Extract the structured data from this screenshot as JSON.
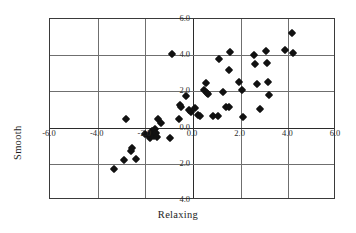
{
  "chart_data": {
    "type": "scatter",
    "title": "",
    "xlabel": "Relaxing",
    "ylabel": "Smooth",
    "xlim": [
      -6.0,
      6.0
    ],
    "ylim": [
      -4.0,
      6.0
    ],
    "xticks": [
      -6.0,
      -4.0,
      -2.0,
      0.0,
      2.0,
      4.0,
      6.0
    ],
    "yticks": [
      -4.0,
      -2.0,
      0.0,
      2.0,
      4.0,
      6.0
    ],
    "xtick_labels": [
      "-6.0",
      "-4.0",
      "-2.0",
      "0.0",
      "2.0",
      "4.0",
      "6.0"
    ],
    "ytick_labels": [
      "4.0",
      "2.0",
      "0.0",
      "2.0",
      "4.0",
      "6.0"
    ],
    "grid": true,
    "legend": false,
    "marker": "diamond",
    "marker_color": "#111111",
    "points": [
      [
        -3.3,
        -2.3
      ],
      [
        -2.9,
        -1.8
      ],
      [
        -2.8,
        0.45
      ],
      [
        -2.6,
        -1.3
      ],
      [
        -2.55,
        -1.1
      ],
      [
        -2.4,
        -1.75
      ],
      [
        -2.0,
        -0.35
      ],
      [
        -1.85,
        -0.45
      ],
      [
        -1.8,
        -0.55
      ],
      [
        -1.75,
        -0.3
      ],
      [
        -1.7,
        -0.2
      ],
      [
        -1.65,
        -0.45
      ],
      [
        -1.6,
        -0.1
      ],
      [
        -1.55,
        -0.3
      ],
      [
        -1.5,
        -0.5
      ],
      [
        -1.45,
        0.45
      ],
      [
        -1.35,
        0.25
      ],
      [
        -0.95,
        -0.6
      ],
      [
        -0.9,
        4.05
      ],
      [
        -0.6,
        0.5
      ],
      [
        -0.55,
        1.25
      ],
      [
        -0.5,
        1.15
      ],
      [
        -0.3,
        1.75
      ],
      [
        -0.15,
        0.95
      ],
      [
        -0.1,
        0.85
      ],
      [
        0.1,
        1.1
      ],
      [
        0.2,
        0.7
      ],
      [
        0.3,
        0.65
      ],
      [
        0.45,
        2.1
      ],
      [
        0.55,
        2.45
      ],
      [
        0.6,
        1.9
      ],
      [
        0.65,
        1.85
      ],
      [
        0.85,
        0.65
      ],
      [
        1.05,
        0.65
      ],
      [
        1.1,
        3.8
      ],
      [
        1.25,
        1.95
      ],
      [
        1.4,
        1.15
      ],
      [
        1.5,
        1.15
      ],
      [
        1.5,
        3.2
      ],
      [
        1.55,
        4.15
      ],
      [
        1.95,
        2.5
      ],
      [
        2.05,
        2.1
      ],
      [
        2.1,
        0.6
      ],
      [
        2.55,
        4.0
      ],
      [
        2.6,
        3.5
      ],
      [
        2.7,
        2.4
      ],
      [
        2.8,
        1.05
      ],
      [
        3.05,
        4.25
      ],
      [
        3.1,
        3.55
      ],
      [
        3.15,
        2.5
      ],
      [
        3.2,
        1.8
      ],
      [
        3.85,
        4.3
      ],
      [
        4.15,
        5.25
      ],
      [
        4.2,
        4.1
      ]
    ]
  }
}
